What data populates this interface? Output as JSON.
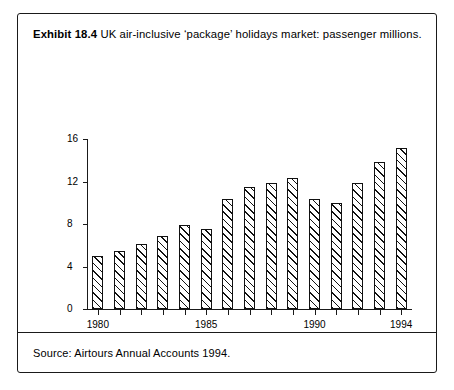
{
  "exhibit": {
    "label": "Exhibit 18.4",
    "caption": "UK air-inclusive ‘package’ holidays market: passenger millions.",
    "source": "Source: Airtours Annual Accounts 1994."
  },
  "colors": {
    "ink": "#111111",
    "border": "#1a1a1a",
    "bar_fill": "#ffffff",
    "page": "#ffffff"
  },
  "chart_data": {
    "type": "bar",
    "title": "UK air-inclusive ‘package’ holidays market: passenger millions.",
    "xlabel": "",
    "ylabel": "",
    "categories": [
      "1980",
      "1981",
      "1982",
      "1983",
      "1984",
      "1985",
      "1986",
      "1987",
      "1988",
      "1989",
      "1990",
      "1991",
      "1992",
      "1993",
      "1994"
    ],
    "values": [
      5.0,
      5.5,
      6.1,
      6.9,
      7.9,
      7.5,
      10.4,
      11.5,
      11.9,
      12.3,
      10.4,
      10.0,
      11.9,
      13.8,
      15.2
    ],
    "ylim": [
      0,
      16
    ],
    "yticks": [
      0,
      4,
      8,
      12,
      16
    ],
    "ytick_labels": [
      "0",
      "4",
      "8",
      "12",
      "16"
    ],
    "xtick_labels": [
      "1980",
      "1985",
      "1990",
      "1994"
    ],
    "xtick_categories": [
      "1980",
      "1985",
      "1990",
      "1994"
    ],
    "grid": false,
    "legend": false,
    "bar_style": "hatched-diagonal-outline"
  }
}
